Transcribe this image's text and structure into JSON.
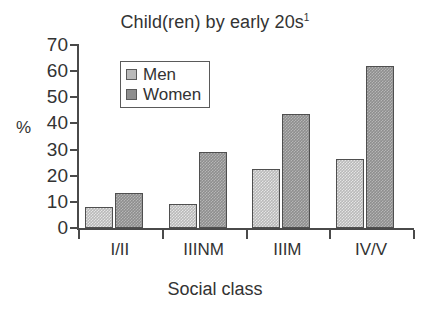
{
  "chart_data": {
    "type": "bar",
    "title": "Child(ren) by early 20s",
    "title_superscript": "1",
    "xlabel": "Social class",
    "ylabel": "%",
    "categories": [
      "I/II",
      "IIINM",
      "IIIM",
      "IV/V"
    ],
    "series": [
      {
        "name": "Men",
        "values": [
          8,
          9,
          22.5,
          26.5
        ],
        "color": "#b9b9b9"
      },
      {
        "name": "Women",
        "values": [
          13.5,
          29,
          43.5,
          62
        ],
        "color": "#8e8e8e"
      }
    ],
    "ylim": [
      0,
      70
    ],
    "yticks": [
      0,
      10,
      20,
      30,
      40,
      50,
      60,
      70
    ],
    "ytick_labels": [
      "0",
      "10",
      "20",
      "30",
      "40",
      "50",
      "60",
      "70"
    ],
    "grid": false,
    "legend_position": "top-left-inside"
  }
}
